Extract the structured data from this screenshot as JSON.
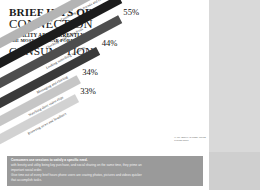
{
  "title": {
    "line1": "BRIEF HITS OF",
    "line2": "CONNECTION",
    "line3": "& UTILITY ARE CURRENTLY",
    "line4": "THE MOST POPULAR FORMS OF",
    "line5": "CONSUMPTION"
  },
  "footnote": {
    "text": "% use mobile in-home during waking hours"
  },
  "footer": {
    "lead": "Consumers use sessions to satisfy a specific need.",
    "line1": "Consumers also use functionality designed for brief replenishment within a few minutes,",
    "line2": "with brevity and utility being key purchase, and social sharing on the same time, they prime an",
    "line3": "important social order.",
    "line4": "Give time out of every brief hours phone users are craving photos, pictures and videos quicker",
    "line5": "that accomplish tasks."
  },
  "chart_data": {
    "type": "bar",
    "title": "BRIEF HITS OF CONNECTION & UTILITY ARE CURRENTLY THE MOST POPULAR FORMS OF CONSUMPTION",
    "xlabel": "",
    "ylabel": "Share of users",
    "xlim": [
      0,
      100
    ],
    "grid": false,
    "legend": false,
    "orientation": "diagonal-bar",
    "unit": "%",
    "categories": [
      "Connecting with friends and family",
      "Checking social media feeds",
      "Looking something up quickly",
      "Messaging and chatting",
      "Watching short video clips",
      "Browsing news and headlines"
    ],
    "values": [
      73,
      55,
      55,
      44,
      34,
      33
    ],
    "value_labels": [
      "73%",
      "55%",
      "55%",
      "44%",
      "34%",
      "33%"
    ],
    "colors": [
      "#b4b4b4",
      "#1c1c1c",
      "#4e4e4e",
      "#3a3a3a",
      "#c6c6c6",
      "#d2d2d2"
    ]
  }
}
